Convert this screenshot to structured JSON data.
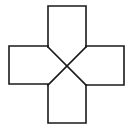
{
  "diagram": {
    "stroke_color": "#1a1a1a",
    "background_color": "#ffffff",
    "stroke_width": 1.6,
    "arms": {
      "top": {
        "x1": 48,
        "x2": 86,
        "y_outer": 6,
        "y_inner": 47
      },
      "bottom": {
        "x1": 48,
        "x2": 86,
        "y_outer": 123,
        "y_inner": 85
      },
      "left": {
        "y1": 46,
        "y2": 84,
        "x_outer": 9,
        "x_inner": 48
      },
      "right": {
        "y1": 46,
        "y2": 85,
        "x_outer": 124,
        "x_inner": 86
      }
    },
    "center": {
      "x": 67,
      "y": 66
    },
    "diagonals": [
      {
        "from": [
          48,
          47
        ],
        "to": [
          86,
          85
        ]
      },
      {
        "from": [
          86,
          47
        ],
        "to": [
          48,
          85
        ]
      }
    ]
  }
}
